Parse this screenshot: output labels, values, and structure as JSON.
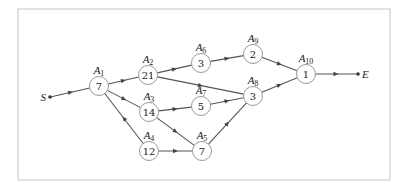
{
  "diagram": {
    "type": "activity-network",
    "frame": {
      "x": 18,
      "y": 9,
      "width": 372,
      "height": 171,
      "stroke": "#c8c8c8"
    },
    "terminals": [
      {
        "id": "S",
        "label": "S",
        "x": 50,
        "y": 97,
        "label_side": "left"
      },
      {
        "id": "E",
        "label": "E",
        "x": 358,
        "y": 74,
        "label_side": "right"
      }
    ],
    "nodes": [
      {
        "id": "A1",
        "label": "A",
        "sub": "1",
        "value": "7",
        "x": 99,
        "y": 86
      },
      {
        "id": "A2",
        "label": "A",
        "sub": "2",
        "value": "21",
        "x": 148,
        "y": 75
      },
      {
        "id": "A3",
        "label": "A",
        "sub": "3",
        "value": "14",
        "x": 149,
        "y": 112
      },
      {
        "id": "A4",
        "label": "A",
        "sub": "4",
        "value": "12",
        "x": 149,
        "y": 151
      },
      {
        "id": "A5",
        "label": "A",
        "sub": "5",
        "value": "7",
        "x": 202,
        "y": 151
      },
      {
        "id": "A6",
        "label": "A",
        "sub": "6",
        "value": "3",
        "x": 201,
        "y": 63
      },
      {
        "id": "A7",
        "label": "A",
        "sub": "7",
        "value": "5",
        "x": 201,
        "y": 106
      },
      {
        "id": "A8",
        "label": "A",
        "sub": "8",
        "value": "3",
        "x": 253,
        "y": 96
      },
      {
        "id": "A9",
        "label": "A",
        "sub": "9",
        "value": "2",
        "x": 253,
        "y": 54
      },
      {
        "id": "A10",
        "label": "A",
        "sub": "10",
        "value": "1",
        "x": 306,
        "y": 74
      }
    ],
    "edges": [
      {
        "from": "S",
        "to": "A1"
      },
      {
        "from": "A1",
        "to": "A2"
      },
      {
        "from": "A1",
        "to": "A3"
      },
      {
        "from": "A4",
        "to": "A1"
      },
      {
        "from": "A2",
        "to": "A6"
      },
      {
        "from": "A2",
        "to": "A8"
      },
      {
        "from": "A3",
        "to": "A7"
      },
      {
        "from": "A3",
        "to": "A5"
      },
      {
        "from": "A4",
        "to": "A5"
      },
      {
        "from": "A6",
        "to": "A9"
      },
      {
        "from": "A7",
        "to": "A8"
      },
      {
        "from": "A5",
        "to": "A8"
      },
      {
        "from": "A9",
        "to": "A10"
      },
      {
        "from": "A8",
        "to": "A10"
      },
      {
        "from": "A10",
        "to": "E"
      }
    ],
    "node_radius": 9.5
  }
}
